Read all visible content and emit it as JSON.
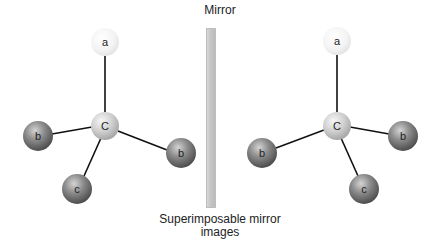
{
  "figure": {
    "mirror_label": "Mirror",
    "caption_line1": "Superimposable mirror",
    "caption_line2": "images"
  },
  "left_molecule": {
    "central": {
      "label": "C",
      "x": 105,
      "y": 126
    },
    "atoms": [
      {
        "label": "a",
        "x": 105,
        "y": 42,
        "shade": "light"
      },
      {
        "label": "b",
        "x": 38,
        "y": 136,
        "shade": "dark"
      },
      {
        "label": "b",
        "x": 181,
        "y": 153,
        "shade": "dark"
      },
      {
        "label": "c",
        "x": 77,
        "y": 189,
        "shade": "dark"
      }
    ]
  },
  "right_molecule": {
    "central": {
      "label": "C",
      "x": 337,
      "y": 126
    },
    "atoms": [
      {
        "label": "a",
        "x": 337,
        "y": 41,
        "shade": "light"
      },
      {
        "label": "b",
        "x": 262,
        "y": 153,
        "shade": "dark"
      },
      {
        "label": "b",
        "x": 403,
        "y": 136,
        "shade": "dark"
      },
      {
        "label": "c",
        "x": 364,
        "y": 189,
        "shade": "dark"
      }
    ]
  },
  "colors": {
    "bond": "#111111",
    "light_atom": "#f2f2f2",
    "central_atom": "#d0d0d0",
    "dark_atom": "#7a7a7a",
    "mirror": "#c8c8c8"
  }
}
